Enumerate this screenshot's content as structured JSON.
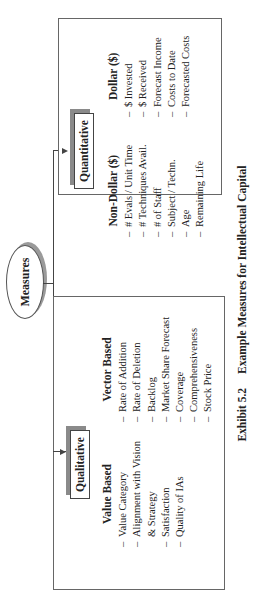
{
  "diagram": {
    "root": {
      "label": "Measures"
    },
    "branches": [
      {
        "label": "Qualitative",
        "columns": [
          {
            "header": "Value Based",
            "items": [
              "Value Category",
              "Alignment with Vision",
              "& Strategy",
              "Satisfaction",
              "Quality of IAs"
            ]
          },
          {
            "header": "Vector Based",
            "items": [
              "Rate of Addition",
              "Rate of Deletion",
              "Backlog",
              "Market Share Forecast",
              "Coverage",
              "Comprehensiveness",
              "Stock Price"
            ]
          }
        ]
      },
      {
        "label": "Quantitative",
        "columns": [
          {
            "header": "Non-Dollar ($)",
            "items": [
              "# Evals / Unit Time",
              "# Techniques Avail.",
              "# of Staff",
              "Subject / Techn.",
              "Age",
              "Remaining Life"
            ]
          },
          {
            "header": "Dollar ($)",
            "items": [
              "$ Invested",
              "$ Received",
              "Forecast Income",
              "Costs to Date",
              "Forecasted Costs"
            ]
          }
        ]
      }
    ],
    "dash": "–"
  },
  "caption": {
    "number": "Exhibit 5.2",
    "title": "Example Measures for Intellectual Capital"
  }
}
